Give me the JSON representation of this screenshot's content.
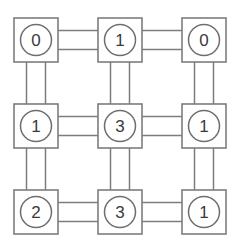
{
  "diagram": {
    "type": "grid-graph",
    "canvas": {
      "width": 231,
      "height": 243,
      "background": "#ffffff"
    },
    "style": {
      "box_stroke": "#7d7d7d",
      "circle_stroke": "#6e6e6e",
      "edge_stroke": "#7d7d7d",
      "label_color": "#3a3a3a",
      "box_size": 44,
      "circle_radius": 15.5,
      "edge_gap": 19
    },
    "grid": {
      "rows": 3,
      "cols": 3,
      "col_centers": [
        36,
        120,
        204
      ],
      "row_centers": [
        40,
        126,
        212
      ]
    },
    "nodes": [
      {
        "id": "n00",
        "row": 0,
        "col": 0,
        "cx": 36,
        "cy": 40,
        "label": "0"
      },
      {
        "id": "n01",
        "row": 0,
        "col": 1,
        "cx": 120,
        "cy": 40,
        "label": "1"
      },
      {
        "id": "n02",
        "row": 0,
        "col": 2,
        "cx": 204,
        "cy": 40,
        "label": "0"
      },
      {
        "id": "n10",
        "row": 1,
        "col": 0,
        "cx": 36,
        "cy": 126,
        "label": "1"
      },
      {
        "id": "n11",
        "row": 1,
        "col": 1,
        "cx": 120,
        "cy": 126,
        "label": "3"
      },
      {
        "id": "n12",
        "row": 1,
        "col": 2,
        "cx": 204,
        "cy": 126,
        "label": "1"
      },
      {
        "id": "n20",
        "row": 2,
        "col": 0,
        "cx": 36,
        "cy": 212,
        "label": "2"
      },
      {
        "id": "n21",
        "row": 2,
        "col": 1,
        "cx": 120,
        "cy": 212,
        "label": "3"
      },
      {
        "id": "n22",
        "row": 2,
        "col": 2,
        "cx": 204,
        "cy": 212,
        "label": "1"
      }
    ],
    "edges": [
      {
        "id": "e-h-r0-c0c1",
        "from": "n00",
        "to": "n01",
        "orientation": "horizontal"
      },
      {
        "id": "e-h-r0-c1c2",
        "from": "n01",
        "to": "n02",
        "orientation": "horizontal"
      },
      {
        "id": "e-h-r1-c0c1",
        "from": "n10",
        "to": "n11",
        "orientation": "horizontal"
      },
      {
        "id": "e-h-r1-c1c2",
        "from": "n11",
        "to": "n12",
        "orientation": "horizontal"
      },
      {
        "id": "e-h-r2-c0c1",
        "from": "n20",
        "to": "n21",
        "orientation": "horizontal"
      },
      {
        "id": "e-h-r2-c1c2",
        "from": "n21",
        "to": "n22",
        "orientation": "horizontal"
      },
      {
        "id": "e-v-c0-r0r1",
        "from": "n00",
        "to": "n10",
        "orientation": "vertical"
      },
      {
        "id": "e-v-c1-r0r1",
        "from": "n01",
        "to": "n11",
        "orientation": "vertical"
      },
      {
        "id": "e-v-c2-r0r1",
        "from": "n02",
        "to": "n12",
        "orientation": "vertical"
      },
      {
        "id": "e-v-c0-r1r2",
        "from": "n10",
        "to": "n20",
        "orientation": "vertical"
      },
      {
        "id": "e-v-c1-r1r2",
        "from": "n11",
        "to": "n21",
        "orientation": "vertical"
      },
      {
        "id": "e-v-c2-r1r2",
        "from": "n12",
        "to": "n22",
        "orientation": "vertical"
      }
    ]
  }
}
